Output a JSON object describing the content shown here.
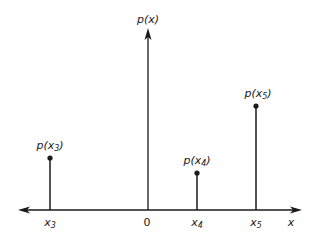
{
  "diagram": {
    "type": "discrete-probability-stem-plot",
    "axis": {
      "x_label": "x",
      "y_label": "p(x)",
      "origin_label": "0"
    },
    "stems": [
      {
        "id": "x3",
        "x_label": "x",
        "x_sub": "3",
        "p_label_prefix": "p(x",
        "p_sub": "3",
        "p_label_suffix": ")"
      },
      {
        "id": "x4",
        "x_label": "x",
        "x_sub": "4",
        "p_label_prefix": "p(x",
        "p_sub": "4",
        "p_label_suffix": ")"
      },
      {
        "id": "x5",
        "x_label": "x",
        "x_sub": "5",
        "p_label_prefix": "p(x",
        "p_sub": "5",
        "p_label_suffix": ")"
      }
    ],
    "colors": {
      "ink": "#1a1a1a",
      "background": "#ffffff"
    }
  }
}
